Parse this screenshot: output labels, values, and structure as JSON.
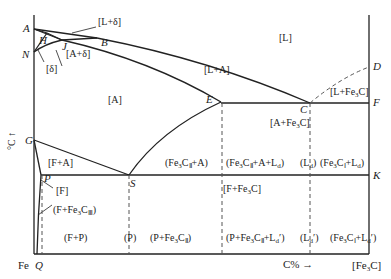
{
  "figure": {
    "y_axis_label": "°C",
    "y_axis_arrow": "↑",
    "x_axis_label": "C%",
    "x_axis_arrow": "→",
    "x_left_end": "Fe",
    "x_right_end": "[Fe3C]",
    "line_color": "#222222",
    "dashed_color": "#555555"
  },
  "points": {
    "A": "A",
    "H": "H",
    "J": "J",
    "B": "B",
    "N": "N",
    "D": "D",
    "E": "E",
    "C": "C",
    "F": "F",
    "G": "G",
    "P": "P",
    "S": "S",
    "K": "K",
    "Q": "Q"
  },
  "regions": {
    "L_delta": "[L+δ]",
    "A_delta": "[A+δ]",
    "delta": "[δ]",
    "L": "[L]",
    "L_A": "[L+A]",
    "A": "[A]",
    "L_Fe3C": "[L+Fe3C]",
    "A_Fe3C": "[A+Fe3C]",
    "F_A": "[F+A]",
    "F": "[F]",
    "F_Fe3C": "[F+Fe3C]",
    "F_Fe3CIII": "(F+Fe3CIII)",
    "Fe3CII_A": "(Fe3CII+A)",
    "Fe3CII_A_Ld": "(Fe3CII+A+Ld)",
    "Ld": "(Ld)",
    "Fe3CI_Ld": "(Fe3CI+Ld)",
    "F_P": "(F+P)",
    "P": "(P)",
    "P_Fe3CII": "(P+Fe3CII)",
    "P_Fe3CII_Ldp": "(P+Fe3CII+Ld′)",
    "Ldp": "(Ld′)",
    "Fe3CI_Ldp": "(Fe3CI+Ld′)"
  }
}
